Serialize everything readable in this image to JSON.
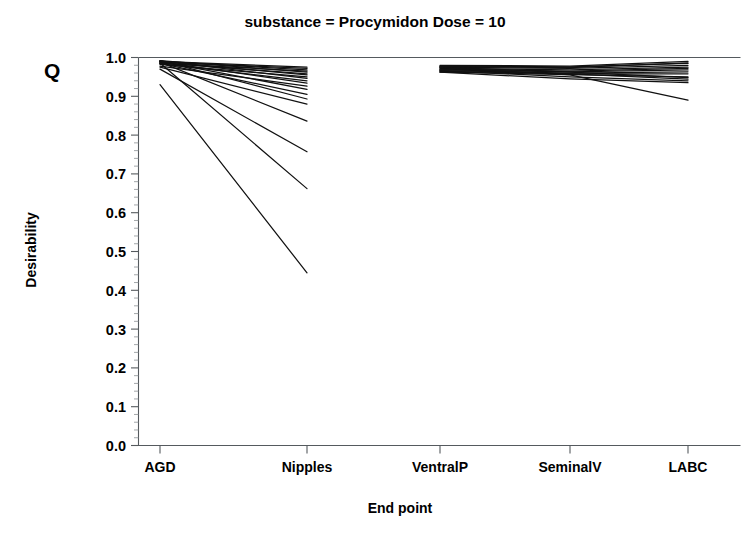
{
  "chart_data": {
    "type": "line",
    "title": "substance = Procymidon  Dose = 10",
    "annotation": "Q",
    "xlabel": "End point",
    "ylabel": "Desirability",
    "categories": [
      "AGD",
      "Nipples",
      "VentralP",
      "SeminalV",
      "LABC"
    ],
    "ylim": [
      0.0,
      1.0
    ],
    "yticks": [
      "0.0",
      "0.1",
      "0.2",
      "0.3",
      "0.4",
      "0.5",
      "0.6",
      "0.7",
      "0.8",
      "0.9",
      "1.0"
    ],
    "grid": false,
    "legend": "none",
    "line_color": "#111111",
    "note": "Two disconnected panels: AGD-Nipples and VentralP-SeminalV-LABC. Null values break each profile between Nipples and VentralP.",
    "series": [
      {
        "name": "profile-01",
        "values": [
          0.99,
          0.975,
          null,
          null,
          null
        ]
      },
      {
        "name": "profile-02",
        "values": [
          0.988,
          0.972,
          null,
          null,
          null
        ]
      },
      {
        "name": "profile-03",
        "values": [
          0.99,
          0.968,
          null,
          null,
          null
        ]
      },
      {
        "name": "profile-04",
        "values": [
          0.985,
          0.965,
          null,
          null,
          null
        ]
      },
      {
        "name": "profile-05",
        "values": [
          0.992,
          0.962,
          null,
          null,
          null
        ]
      },
      {
        "name": "profile-06",
        "values": [
          0.986,
          0.958,
          null,
          null,
          null
        ]
      },
      {
        "name": "profile-07",
        "values": [
          0.99,
          0.955,
          null,
          null,
          null
        ]
      },
      {
        "name": "profile-08",
        "values": [
          0.982,
          0.95,
          null,
          null,
          null
        ]
      },
      {
        "name": "profile-09",
        "values": [
          0.991,
          0.946,
          null,
          null,
          null
        ]
      },
      {
        "name": "profile-10",
        "values": [
          0.984,
          0.94,
          null,
          null,
          null
        ]
      },
      {
        "name": "profile-11",
        "values": [
          0.989,
          0.934,
          null,
          null,
          null
        ]
      },
      {
        "name": "profile-12",
        "values": [
          0.978,
          0.926,
          null,
          null,
          null
        ]
      },
      {
        "name": "profile-13",
        "values": [
          0.99,
          0.918,
          null,
          null,
          null
        ]
      },
      {
        "name": "profile-14",
        "values": [
          0.985,
          0.905,
          null,
          null,
          null
        ]
      },
      {
        "name": "profile-15",
        "values": [
          0.992,
          0.893,
          null,
          null,
          null
        ]
      },
      {
        "name": "profile-16",
        "values": [
          0.975,
          0.88,
          null,
          null,
          null
        ]
      },
      {
        "name": "profile-17",
        "values": [
          0.988,
          0.836,
          null,
          null,
          null
        ]
      },
      {
        "name": "profile-18",
        "values": [
          0.97,
          0.757,
          null,
          null,
          null
        ]
      },
      {
        "name": "profile-19",
        "values": [
          0.986,
          0.662,
          null,
          null,
          null
        ]
      },
      {
        "name": "profile-20",
        "values": [
          0.93,
          0.445,
          null,
          null,
          null
        ]
      },
      {
        "name": "profile-21",
        "values": [
          null,
          null,
          0.978,
          0.976,
          0.985
        ]
      },
      {
        "name": "profile-22",
        "values": [
          null,
          null,
          0.975,
          0.972,
          0.98
        ]
      },
      {
        "name": "profile-23",
        "values": [
          null,
          null,
          0.972,
          0.968,
          0.975
        ]
      },
      {
        "name": "profile-24",
        "values": [
          null,
          null,
          0.97,
          0.965,
          0.972
        ]
      },
      {
        "name": "profile-25",
        "values": [
          null,
          null,
          0.968,
          0.963,
          0.968
        ]
      },
      {
        "name": "profile-26",
        "values": [
          null,
          null,
          0.966,
          0.96,
          0.963
        ]
      },
      {
        "name": "profile-27",
        "values": [
          null,
          null,
          0.964,
          0.958,
          0.958
        ]
      },
      {
        "name": "profile-28",
        "values": [
          null,
          null,
          0.962,
          0.956,
          0.95
        ]
      },
      {
        "name": "profile-29",
        "values": [
          null,
          null,
          0.975,
          0.962,
          0.948
        ]
      },
      {
        "name": "profile-30",
        "values": [
          null,
          null,
          0.97,
          0.958,
          0.944
        ]
      },
      {
        "name": "profile-31",
        "values": [
          null,
          null,
          0.966,
          0.95,
          0.94
        ]
      },
      {
        "name": "profile-32",
        "values": [
          null,
          null,
          0.962,
          0.945,
          0.935
        ]
      },
      {
        "name": "profile-33",
        "values": [
          null,
          null,
          0.974,
          0.955,
          0.89
        ]
      },
      {
        "name": "profile-34",
        "values": [
          null,
          null,
          0.98,
          0.978,
          0.99
        ]
      },
      {
        "name": "profile-35",
        "values": [
          null,
          null,
          0.977,
          0.974,
          0.986
        ]
      }
    ]
  },
  "axes": {
    "x_tick_labels": [
      "AGD",
      "Nipples",
      "VentralP",
      "SeminalV",
      "LABC"
    ],
    "y_tick_labels": [
      "1.0",
      "0.9",
      "0.8",
      "0.7",
      "0.6",
      "0.5",
      "0.4",
      "0.3",
      "0.2",
      "0.1",
      "0.0"
    ]
  }
}
